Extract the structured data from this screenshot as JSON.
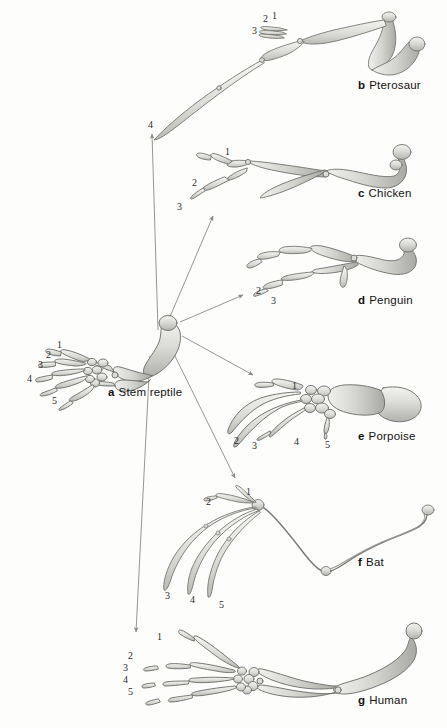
{
  "figure": {
    "background_color": "#fdfdfc",
    "bone_fill_light": "#e9e9e5",
    "bone_fill_mid": "#c9c9c4",
    "bone_fill_dark": "#a3a39e",
    "bone_outline": "#6f6f6b",
    "arrow_color": "#8a8a86",
    "label_color": "#121212"
  },
  "taxa": [
    {
      "id": "a",
      "tag": "a",
      "name": "Stem reptile",
      "label_x": 108,
      "label_y": 386,
      "digits": [
        "1",
        "2",
        "3",
        "4",
        "5"
      ]
    },
    {
      "id": "b",
      "tag": "b",
      "name": "Pterosaur",
      "label_x": 358,
      "label_y": 79,
      "digits": [
        "1",
        "2",
        "3",
        "4"
      ]
    },
    {
      "id": "c",
      "tag": "c",
      "name": "Chicken",
      "label_x": 358,
      "label_y": 187,
      "digits": [
        "1",
        "2",
        "3"
      ]
    },
    {
      "id": "d",
      "tag": "d",
      "name": "Penguin",
      "label_x": 358,
      "label_y": 294,
      "digits": [
        "2",
        "3"
      ]
    },
    {
      "id": "e",
      "tag": "e",
      "name": "Porpoise",
      "label_x": 358,
      "label_y": 430,
      "digits": [
        "1",
        "2",
        "3",
        "4",
        "5"
      ]
    },
    {
      "id": "f",
      "tag": "f",
      "name": "Bat",
      "label_x": 358,
      "label_y": 556,
      "digits": [
        "1",
        "2",
        "3",
        "4",
        "5"
      ]
    },
    {
      "id": "g",
      "tag": "g",
      "name": "Human",
      "label_x": 358,
      "label_y": 694,
      "digits": [
        "1",
        "2",
        "3",
        "4",
        "5"
      ]
    }
  ],
  "digit_labels": [
    {
      "taxon": "b",
      "text": "1",
      "x": 272,
      "y": 11
    },
    {
      "taxon": "b",
      "text": "2",
      "x": 263,
      "y": 14
    },
    {
      "taxon": "b",
      "text": "3",
      "x": 252,
      "y": 26
    },
    {
      "taxon": "b",
      "text": "4",
      "x": 148,
      "y": 120
    },
    {
      "taxon": "c",
      "text": "1",
      "x": 225,
      "y": 147
    },
    {
      "taxon": "c",
      "text": "2",
      "x": 192,
      "y": 178
    },
    {
      "taxon": "c",
      "text": "3",
      "x": 177,
      "y": 202
    },
    {
      "taxon": "d",
      "text": "2",
      "x": 256,
      "y": 286
    },
    {
      "taxon": "d",
      "text": "3",
      "x": 271,
      "y": 296
    },
    {
      "taxon": "a",
      "text": "1",
      "x": 57,
      "y": 340
    },
    {
      "taxon": "a",
      "text": "2",
      "x": 46,
      "y": 350
    },
    {
      "taxon": "a",
      "text": "3",
      "x": 38,
      "y": 360
    },
    {
      "taxon": "a",
      "text": "4",
      "x": 27,
      "y": 374
    },
    {
      "taxon": "a",
      "text": "5",
      "x": 52,
      "y": 396
    },
    {
      "taxon": "e",
      "text": "1",
      "x": 292,
      "y": 381
    },
    {
      "taxon": "e",
      "text": "2",
      "x": 234,
      "y": 436
    },
    {
      "taxon": "e",
      "text": "3",
      "x": 252,
      "y": 441
    },
    {
      "taxon": "e",
      "text": "4",
      "x": 294,
      "y": 437
    },
    {
      "taxon": "e",
      "text": "5",
      "x": 325,
      "y": 440
    },
    {
      "taxon": "f",
      "text": "1",
      "x": 246,
      "y": 487
    },
    {
      "taxon": "f",
      "text": "2",
      "x": 206,
      "y": 497
    },
    {
      "taxon": "f",
      "text": "3",
      "x": 165,
      "y": 591
    },
    {
      "taxon": "f",
      "text": "4",
      "x": 190,
      "y": 595
    },
    {
      "taxon": "f",
      "text": "5",
      "x": 219,
      "y": 600
    },
    {
      "taxon": "g",
      "text": "1",
      "x": 157,
      "y": 632
    },
    {
      "taxon": "g",
      "text": "2",
      "x": 128,
      "y": 651
    },
    {
      "taxon": "g",
      "text": "3",
      "x": 123,
      "y": 663
    },
    {
      "taxon": "g",
      "text": "4",
      "x": 123,
      "y": 675
    },
    {
      "taxon": "g",
      "text": "5",
      "x": 128,
      "y": 687
    }
  ],
  "arrows": [
    {
      "id": "to-pterosaur",
      "from_x": 158,
      "from_y": 330,
      "to_x": 152,
      "to_y": 134
    },
    {
      "id": "to-chicken",
      "from_x": 166,
      "from_y": 326,
      "to_x": 213,
      "to_y": 216
    },
    {
      "id": "to-penguin",
      "from_x": 180,
      "from_y": 322,
      "to_x": 243,
      "to_y": 295
    },
    {
      "id": "to-porpoise",
      "from_x": 182,
      "from_y": 336,
      "to_x": 253,
      "to_y": 375
    },
    {
      "id": "to-bat",
      "from_x": 172,
      "from_y": 350,
      "to_x": 235,
      "to_y": 478
    },
    {
      "id": "to-human",
      "from_x": 150,
      "from_y": 356,
      "to_x": 136,
      "to_y": 632
    }
  ]
}
